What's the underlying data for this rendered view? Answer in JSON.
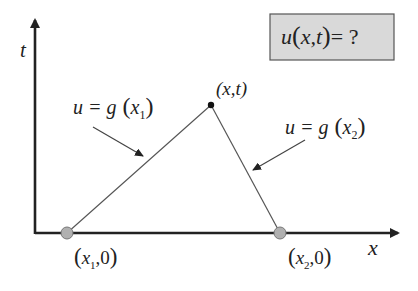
{
  "diagram": {
    "axes": {
      "x_label": "x",
      "t_label": "t"
    },
    "question_box": {
      "text_func": "u",
      "text_open": "(",
      "text_args": "x,t",
      "text_close": ")",
      "text_eq": "= ?",
      "fill": "#d9d9d9",
      "border": "#555555"
    },
    "apex_point": {
      "label": "(x,t)"
    },
    "left_line_label": {
      "lhs": "u = g",
      "arg": "x",
      "sub": "1"
    },
    "right_line_label": {
      "lhs": "u = g",
      "arg": "x",
      "sub": "2"
    },
    "base_points": [
      {
        "var": "x",
        "sub": "1",
        "rest": ",0",
        "fill": "#b0b0b0"
      },
      {
        "var": "x",
        "sub": "2",
        "rest": ",0",
        "fill": "#b0b0b0"
      }
    ],
    "colors": {
      "axis": "#222222",
      "line": "#555555",
      "arrow": "#333333"
    }
  }
}
